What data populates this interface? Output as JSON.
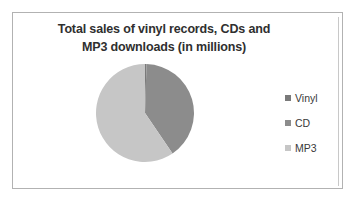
{
  "chart_data": {
    "type": "pie",
    "title": "Total sales of vinyl records, CDs and MP3 downloads (in millions)",
    "title_lines": [
      "Total sales of vinyl records, CDs and",
      "MP3 downloads (in millions)"
    ],
    "categories": [
      "Vinyl",
      "CD",
      "MP3"
    ],
    "values": [
      0.5,
      40,
      59.5
    ],
    "colors": [
      "#7a7a7a",
      "#8c8c8c",
      "#c6c6c6"
    ],
    "legend_position": "right",
    "grid": false,
    "xlabel": "",
    "ylabel": "",
    "start_angle_deg": 0,
    "direction": "clockwise"
  },
  "legend": {
    "items": [
      {
        "label": "Vinyl",
        "color": "#7a7a7a"
      },
      {
        "label": "CD",
        "color": "#8c8c8c"
      },
      {
        "label": "MP3",
        "color": "#c6c6c6"
      }
    ]
  },
  "frame": {
    "border_color": "#b2b2b2",
    "background": "#ffffff"
  }
}
